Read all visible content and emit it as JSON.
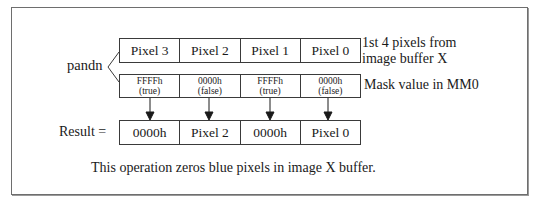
{
  "diagram": {
    "operation_label": "pandn",
    "source_row": {
      "cells": [
        "Pixel 3",
        "Pixel 2",
        "Pixel 1",
        "Pixel 0"
      ],
      "caption_line1": "1st 4 pixels from",
      "caption_line2": "image buffer X"
    },
    "mask_row": {
      "cells": [
        {
          "value": "FFFFh",
          "note": "(true)"
        },
        {
          "value": "0000h",
          "note": "(false)"
        },
        {
          "value": "FFFFh",
          "note": "(true)"
        },
        {
          "value": "0000h",
          "note": "(false)"
        }
      ],
      "caption": "Mask value in MM0"
    },
    "result_row": {
      "label": "Result =",
      "cells": [
        "0000h",
        "Pixel 2",
        "0000h",
        "Pixel 0"
      ]
    },
    "footnote": "This operation zeros blue pixels in image X buffer.",
    "colors": {
      "stroke": "#3a3a3a",
      "frame": "#6e6e6e",
      "text": "#1a1a1a"
    }
  }
}
